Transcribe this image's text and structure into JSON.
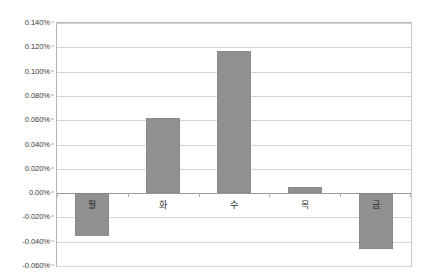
{
  "chart_data": {
    "type": "bar",
    "title": "",
    "subtitle": "",
    "xlabel": "",
    "ylabel": "",
    "categories": [
      "월",
      "화",
      "수",
      "목",
      "금"
    ],
    "values": [
      -0.035,
      0.062,
      0.117,
      0.005,
      -0.046
    ],
    "value_unit": "%",
    "ylim": [
      -0.06,
      0.14
    ],
    "ytick_values": [
      0.14,
      0.12,
      0.1,
      0.08,
      0.06,
      0.04,
      0.02,
      0.0,
      -0.02,
      -0.04,
      -0.06
    ],
    "ytick_labels": [
      "0.140%",
      "0.120%",
      "0.100%",
      "0.080%",
      "0.060%",
      "0.040%",
      "0.020%",
      "0.00%",
      "-0.020%",
      "-0.040%",
      "-0.060%"
    ],
    "grid": true,
    "legend": false,
    "legend_position": "none",
    "series": [
      {
        "name": "",
        "values": [
          -0.035,
          0.062,
          0.117,
          0.005,
          -0.046
        ]
      }
    ],
    "colors": {
      "bar_fill": "#909090",
      "bar_border": "#8a8a8a",
      "gridline": "#d4d4d4",
      "zero_line": "#9a9a9a",
      "plot_border": "#b6b6b6",
      "tick_text": "#3b3b3b",
      "category_text": "#2e2e2e",
      "background": "#ffffff"
    }
  }
}
